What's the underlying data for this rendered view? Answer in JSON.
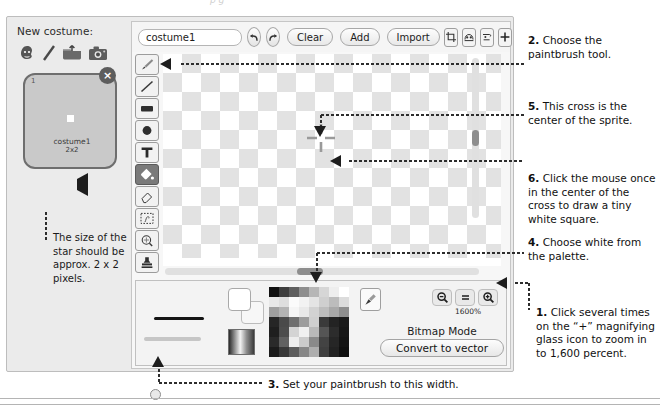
{
  "top_sliver": "p g",
  "costume_panel": {
    "new_costume_label": "New costume:",
    "icons": [
      "paint-sprite-icon",
      "brush-line-icon",
      "upload-folder-icon",
      "camera-icon"
    ],
    "thumbnail": {
      "index": "1",
      "name": "costume1",
      "dimensions": "2x2",
      "close_label": "×"
    },
    "note": "The size of the star should be approx. 2 x 2 pixels."
  },
  "toolbar": {
    "costume_name_value": "costume1",
    "costume_name_placeholder": "costume name",
    "undo_label": "↶",
    "redo_label": "↷",
    "clear_label": "Clear",
    "add_label": "Add",
    "import_label": "Import",
    "right_icons": [
      "crop-icon",
      "flip-horizontal-icon",
      "flip-vertical-icon",
      "set-center-icon"
    ]
  },
  "tools": [
    {
      "name": "paintbrush-tool",
      "selected": false
    },
    {
      "name": "line-tool",
      "selected": false
    },
    {
      "name": "rectangle-tool",
      "selected": false
    },
    {
      "name": "ellipse-tool",
      "selected": false
    },
    {
      "name": "text-tool",
      "selected": false
    },
    {
      "name": "fill-tool",
      "selected": true
    },
    {
      "name": "eraser-tool",
      "selected": false
    },
    {
      "name": "select-tool",
      "selected": false
    },
    {
      "name": "reshape-tool",
      "selected": false
    },
    {
      "name": "stamp-tool",
      "selected": false
    }
  ],
  "canvas": {
    "center_marker": "sprite-center-crosshair"
  },
  "bottom_panel": {
    "brush_width_preview": "thick-line",
    "foreground_color": "#ffffff",
    "background_color": "#f7f7f7",
    "gradient_label": "gradient-swatch",
    "eyedropper": "eyedropper-icon",
    "zoom_out_label": "−",
    "zoom_reset_label": "=",
    "zoom_in_label": "+",
    "zoom_percent": "1600%",
    "bitmap_mode_label": "Bitmap Mode",
    "convert_label": "Convert to vector",
    "palette_rows": [
      [
        "#111111",
        "#3d3d3d",
        "#5e5e5e",
        "#8d8d8d",
        "#b6b6b6",
        "#d6d6d6",
        "#eeeeee",
        "#ffffff"
      ],
      [
        "#e8e8e8",
        "#dedede",
        "#fbfbfb",
        "#f2f2f2",
        "#e4e4e4",
        "#cfcfcf",
        "#bcbcbc",
        "#dcdcdc"
      ],
      [
        "#9f9f9f",
        "#b3b3b3",
        "#f5f5f5",
        "#e9e9e9",
        "#d2d2d2",
        "#bdbdbd",
        "#a8a8a8",
        "#8e8e8e"
      ],
      [
        "#262626",
        "#4a4a4a",
        "#6f6f6f",
        "#9d9d9d",
        "#cfcfcf",
        "#3a3a3a",
        "#232323",
        "#1a1a1a"
      ],
      [
        "#1f1f1f",
        "#4d4d4d",
        "#d4d4d4",
        "#f0f0f0",
        "#b9b9b9",
        "#555555",
        "#2c2c2c",
        "#171717"
      ],
      [
        "#2a2a2a",
        "#616161",
        "#ededed",
        "#cbcbcb",
        "#8a8a8a",
        "#434343",
        "#262626",
        "#141414"
      ],
      [
        "#1b1b1b",
        "#383838",
        "#5c5c5c",
        "#878787",
        "#aeaeae",
        "#3f3f3f",
        "#222222",
        "#101010"
      ]
    ]
  },
  "annotations": {
    "a1_num": "1.",
    "a1_text": " Click several times on the “+” magnifying glass icon to zoom in to 1,600 percent.",
    "a2_num": "2.",
    "a2_text": " Choose the paintbrush tool.",
    "a3_num": "3.",
    "a3_text": " Set your paintbrush to this width.",
    "a4_num": "4.",
    "a4_text": " Choose white from the palette.",
    "a5_num": "5.",
    "a5_text": " This cross is the center of the sprite.",
    "a6_num": "6.",
    "a6_text": " Click the mouse once in the center of the cross to draw a tiny white  square."
  }
}
